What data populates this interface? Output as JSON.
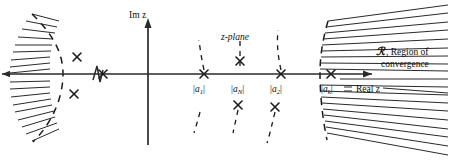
{
  "figure": {
    "plane_label": "z-plane",
    "imaginary_axis_label": "Im z",
    "real_axis_label": "Real z",
    "roc_symbol": "ℛ",
    "roc_label_line1": ", Region of",
    "roc_label_line2": "convergence",
    "colors": {
      "ink": "#1a1a1a",
      "axis": "#2a2a2a",
      "hatch": "#2a2a2a",
      "background": "#ffffff"
    },
    "pole_labels": [
      {
        "id": "a1",
        "base": "|a",
        "sub": "1",
        "close": "|",
        "x": 204
      },
      {
        "id": "aN",
        "base": "|a",
        "sub": "N",
        "close": "|",
        "x": 243
      },
      {
        "id": "a2",
        "base": "|a",
        "sub": "2",
        "close": "|",
        "x": 281
      },
      {
        "id": "ak",
        "base": "|a",
        "sub": "k",
        "close": "|",
        "x": 331
      }
    ],
    "axis_poles": [
      {
        "name": "far-left-pole",
        "x": 103,
        "y": 74
      },
      {
        "name": "pole-a1",
        "x": 204,
        "y": 74
      },
      {
        "name": "pole-a2",
        "x": 281,
        "y": 74
      },
      {
        "name": "pole-ak",
        "x": 331,
        "y": 74
      }
    ],
    "off_axis_poles": [
      {
        "name": "upper-left-pole",
        "x": 77,
        "y": 57
      },
      {
        "name": "lower-left-pole",
        "x": 74,
        "y": 94
      },
      {
        "name": "upper-aN-pole",
        "x": 240,
        "y": 61
      },
      {
        "name": "lower-aN-pole",
        "x": 238,
        "y": 105
      },
      {
        "name": "lower-a2-pole",
        "x": 275,
        "y": 107
      }
    ],
    "axis_break": {
      "name": "axis-break-zigzag",
      "x": 96,
      "y": 74
    },
    "roc": {
      "inner_boundary_note": "dashed arc at |a1| radius, hatching to the left",
      "outer_boundary_note": "dashed arc at |ak| radius, hatching to the right"
    }
  },
  "chart_data": {
    "type": "scatter",
    "title": "z-plane",
    "xlabel": "Real z",
    "ylabel": "Im z",
    "grid": false,
    "legend": null,
    "annotations": [
      "z-plane",
      "Im z",
      "Real z",
      "ℛ , Region of convergence",
      "|a1|",
      "|aN|",
      "|a2|",
      "|ak|"
    ],
    "series": [
      {
        "name": "poles (x markers)",
        "marker": "x",
        "points": [
          {
            "x": 103,
            "y": 74
          },
          {
            "x": 204,
            "y": 74
          },
          {
            "x": 281,
            "y": 74
          },
          {
            "x": 331,
            "y": 74
          },
          {
            "x": 77,
            "y": 57
          },
          {
            "x": 74,
            "y": 94
          },
          {
            "x": 240,
            "y": 61
          },
          {
            "x": 238,
            "y": 105
          },
          {
            "x": 275,
            "y": 107
          }
        ]
      }
    ],
    "radial_markers": [
      {
        "label": "|a1|",
        "radius_x": 204
      },
      {
        "label": "|aN|",
        "radius_x": 243
      },
      {
        "label": "|a2|",
        "radius_x": 281
      },
      {
        "label": "|ak|",
        "radius_x": 331
      }
    ],
    "origin": {
      "x": 148,
      "y": 74
    }
  }
}
